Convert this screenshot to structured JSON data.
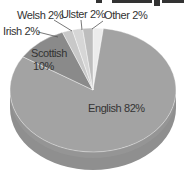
{
  "chart_data": {
    "type": "pie",
    "style": "3d",
    "title": "",
    "title_note": "title text cut off at top edge (not legible)",
    "slices": [
      {
        "label": "English",
        "value": 82,
        "display": "English 82%",
        "color": "#a3a3a3"
      },
      {
        "label": "Scottish",
        "value": 10,
        "display": "Scottish 10%",
        "color": "#8a8a8a"
      },
      {
        "label": "Irish",
        "value": 2,
        "display": "Irish 2%",
        "color": "#c8c8c8"
      },
      {
        "label": "Welsh",
        "value": 2,
        "display": "Welsh 2%",
        "color": "#d6d6d6"
      },
      {
        "label": "Ulster",
        "value": 2,
        "display": "Ulster 2%",
        "color": "#bdbdbd"
      },
      {
        "label": "Other",
        "value": 2,
        "display": "Other 2%",
        "color": "#ececec"
      }
    ],
    "legend": "none (inline labels)",
    "units": "%"
  },
  "labels": {
    "english": "English 82%",
    "scottish_line1": "Scottish",
    "scottish_line2": "10%",
    "irish": "Irish 2%",
    "welsh": "Welsh 2%",
    "ulster": "Ulster 2%",
    "other": "Other 2%"
  }
}
